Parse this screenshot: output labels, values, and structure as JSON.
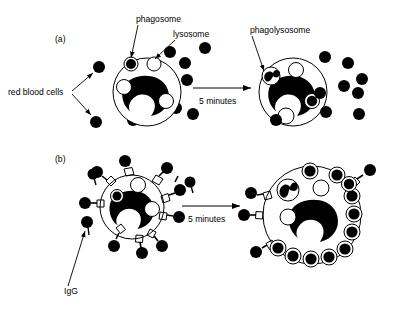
{
  "figure": {
    "background_color": "#ffffff",
    "ink_color": "#000000",
    "width": 402,
    "height": 309
  },
  "panels": [
    {
      "id": "a",
      "label": "(a)",
      "label_x": 55,
      "label_y": 42,
      "description": "Unopsonized red blood cells; little uptake after 5 minutes",
      "arrow": {
        "label": "5 minutes",
        "label_x": 210,
        "label_y": 104,
        "x1": 193,
        "y1": 88,
        "x2": 254,
        "y2": 88
      },
      "callouts": [
        {
          "name": "phagosome",
          "text": "phagosome",
          "text_x": 136,
          "text_y": 22,
          "line_x1": 138,
          "line_y1": 25,
          "line_x2": 131,
          "line_y2": 61
        },
        {
          "name": "lysosome",
          "text": "lysosome",
          "text_x": 173,
          "text_y": 37,
          "line_x1": 175,
          "line_y1": 40,
          "line_x2": 152,
          "line_y2": 61
        },
        {
          "name": "red-blood-cells",
          "text": "red blood cells",
          "text_x": 10,
          "text_y": 94,
          "line_a_x1": 71,
          "line_a_y1": 91,
          "line_a_x2": 93,
          "line_a_y2": 71,
          "line_b_x1": 71,
          "line_b_y1": 93,
          "line_b_x2": 92,
          "line_b_y2": 117
        },
        {
          "name": "phagolysosome",
          "text": "phagolysosome",
          "text_x": 253,
          "text_y": 33,
          "line_x1": 253,
          "line_y1": 36,
          "line_x2": 266,
          "line_y2": 75
        }
      ],
      "cells": [
        {
          "name": "macrophage-before",
          "cx": 147,
          "cy": 92,
          "r": 34,
          "nucleus": "kidney-shaped",
          "organelles": [
            {
              "type": "phagosome",
              "cx": 131,
              "cy": 64,
              "r": 7
            },
            {
              "type": "lysosome",
              "cx": 154,
              "cy": 64,
              "r": 7
            },
            {
              "type": "lysosome",
              "cx": 124,
              "cy": 87,
              "r": 7.5
            },
            {
              "type": "lysosome",
              "cx": 166,
              "cy": 101,
              "r": 7.5
            }
          ]
        },
        {
          "name": "macrophage-after",
          "cx": 293,
          "cy": 92,
          "r": 34,
          "nucleus": "kidney-shaped",
          "organelles": [
            {
              "type": "phagolysosome",
              "cx": 271,
              "cy": 76,
              "r": 9
            },
            {
              "type": "lysosome",
              "cx": 296,
              "cy": 70,
              "r": 7.5
            },
            {
              "type": "phagosome",
              "cx": 312,
              "cy": 101,
              "r": 7.5
            },
            {
              "type": "lysosome",
              "cx": 286,
              "cy": 116,
              "r": 8
            }
          ]
        }
      ],
      "free_red_blood_cells_before": [
        {
          "cx": 99,
          "cy": 67,
          "r": 6
        },
        {
          "cx": 96,
          "cy": 122,
          "r": 6
        },
        {
          "cx": 170,
          "cy": 52,
          "r": 6
        },
        {
          "cx": 185,
          "cy": 63,
          "r": 6
        },
        {
          "cx": 187,
          "cy": 80,
          "r": 6
        },
        {
          "cx": 205,
          "cy": 48,
          "r": 6
        },
        {
          "cx": 176,
          "cy": 108,
          "r": 6
        },
        {
          "cx": 193,
          "cy": 114,
          "r": 6
        },
        {
          "cx": 133,
          "cy": 120,
          "r": 6
        }
      ],
      "free_red_blood_cells_after": [
        {
          "cx": 325,
          "cy": 57,
          "r": 6
        },
        {
          "cx": 320,
          "cy": 93,
          "r": 6
        },
        {
          "cx": 276,
          "cy": 116,
          "r": 6
        },
        {
          "cx": 348,
          "cy": 63,
          "r": 6
        },
        {
          "cx": 362,
          "cy": 79,
          "r": 6
        },
        {
          "cx": 344,
          "cy": 86,
          "r": 6
        },
        {
          "cx": 358,
          "cy": 93,
          "r": 6
        },
        {
          "cx": 326,
          "cy": 112,
          "r": 6
        },
        {
          "cx": 359,
          "cy": 114,
          "r": 6
        }
      ]
    },
    {
      "id": "b",
      "label": "(b)",
      "label_x": 55,
      "label_y": 162,
      "description": "IgG-opsonized red blood cells bind Fc receptors and are rapidly internalized",
      "arrow": {
        "label": "5 minutes",
        "label_x": 198,
        "label_y": 222,
        "x1": 182,
        "y1": 206,
        "x2": 243,
        "y2": 206
      },
      "callouts": [
        {
          "name": "igg",
          "text": "IgG",
          "text_x": 65,
          "text_y": 293,
          "line_x1": 69,
          "line_y1": 286,
          "line_x2": 86,
          "line_y2": 228
        }
      ],
      "cells": [
        {
          "name": "macrophage-before-igg",
          "cx": 132,
          "cy": 207,
          "r": 32,
          "nucleus": "kidney-shaped",
          "receptor_count": 9,
          "organelles": [
            {
              "type": "lysosome",
              "cx": 138,
              "cy": 185,
              "r": 7.5
            },
            {
              "type": "phagosome",
              "cx": 117,
              "cy": 195,
              "r": 6.5
            },
            {
              "type": "lysosome",
              "cx": 152,
              "cy": 208,
              "r": 7.5
            }
          ]
        },
        {
          "name": "macrophage-after-igg",
          "cx": 312,
          "cy": 215,
          "r": 49,
          "nucleus": "kidney-shaped",
          "receptor_count": 3,
          "organelles": [
            {
              "type": "phagolysosome",
              "cx": 288,
              "cy": 190,
              "r": 11
            },
            {
              "type": "lysosome",
              "cx": 321,
              "cy": 188,
              "r": 8
            },
            {
              "type": "lysosome",
              "cx": 288,
              "cy": 216,
              "r": 8
            }
          ],
          "internalized_rbc_count": 14
        }
      ],
      "free_igg_cells": [
        {
          "cx": 97,
          "cy": 175,
          "r": 5.5,
          "tail_angle": 250
        },
        {
          "cx": 192,
          "cy": 182,
          "r": 5.5,
          "tail_angle": 250
        },
        {
          "cx": 89,
          "cy": 222,
          "r": 6,
          "tail_angle": 250
        }
      ]
    }
  ],
  "legend_terms": [
    "phagosome",
    "lysosome",
    "phagolysosome",
    "red blood cells",
    "IgG",
    "5 minutes"
  ]
}
